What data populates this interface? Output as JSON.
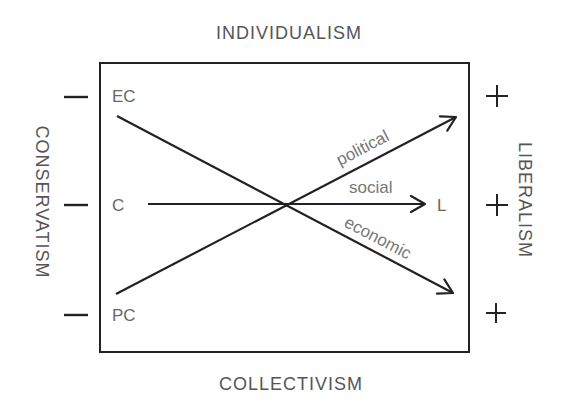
{
  "axes": {
    "top": "INDIVIDUALISM",
    "bottom": "COLLECTIVISM",
    "left": "CONSERVATISM",
    "right": "LIBERALISM"
  },
  "left_signs": [
    "—",
    "—",
    "—"
  ],
  "right_signs": [
    "+",
    "+",
    "+"
  ],
  "points": {
    "ec": "EC",
    "c": "C",
    "pc": "PC",
    "l": "L"
  },
  "lines": {
    "political": "political",
    "social": "social",
    "economic": "economic"
  },
  "colors": {
    "line": "#222222",
    "text": "#555555",
    "background": "#ffffff"
  }
}
